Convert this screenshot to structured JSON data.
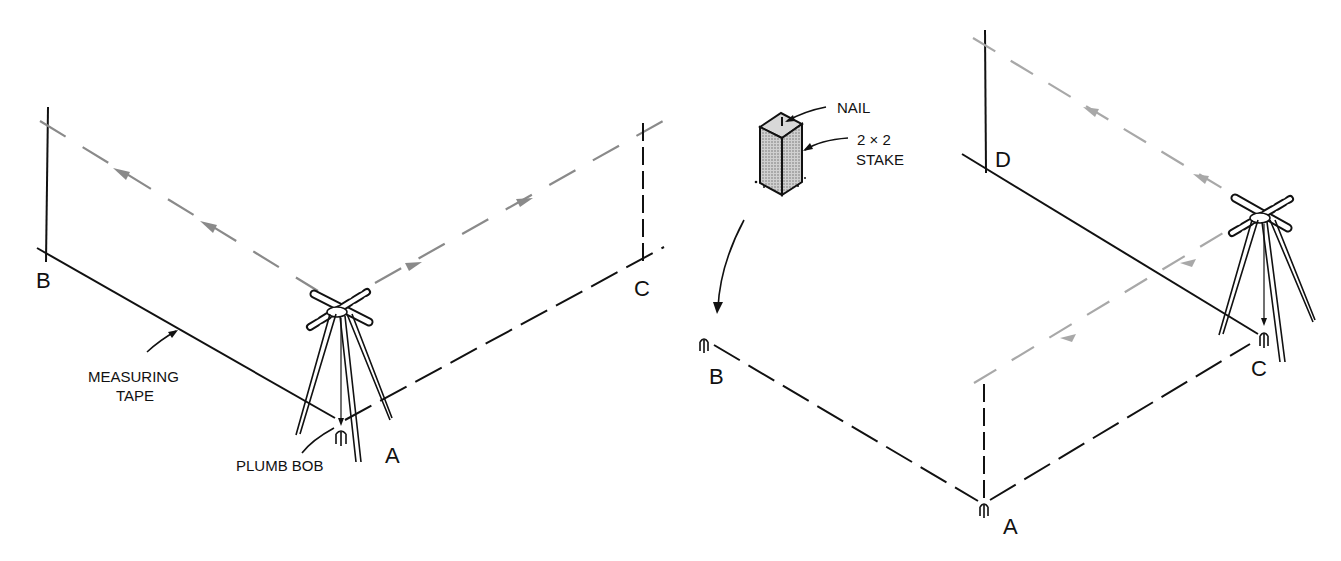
{
  "figure": {
    "left_panel": {
      "labels": {
        "point_b": "B",
        "point_c": "C",
        "point_a": "A",
        "tape_line1": "MEASURING",
        "tape_line2": "TAPE",
        "plumb_bob": "PLUMB BOB"
      },
      "description": "Transit set on tripod over stake A, sighting toward B and C; measuring tape along line A-B"
    },
    "right_panel": {
      "labels": {
        "nail": "NAIL",
        "stake_line1": "2 × 2",
        "stake_line2": "STAKE",
        "point_d": "D",
        "point_b": "B",
        "point_c": "C",
        "point_a": "A"
      },
      "description": "Transit moved to stake C, sighting toward D and A; stakes at A, B, C with nail on top"
    },
    "colors": {
      "ink": "#111111",
      "sight_line": "#8a8a8a",
      "sight_line_light": "#a8a8a8",
      "stake_fill": "#b8b8b8",
      "background": "#ffffff"
    }
  }
}
